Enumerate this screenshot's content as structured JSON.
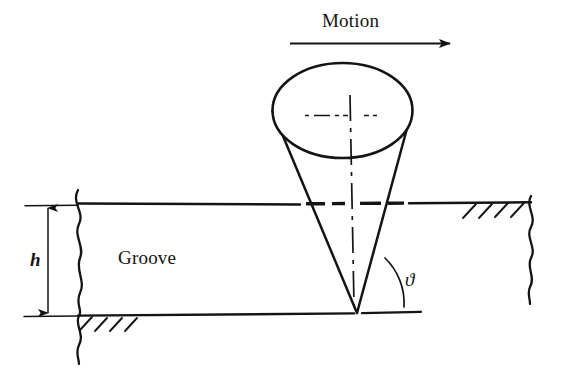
{
  "figure": {
    "type": "engineering-diagram",
    "background_color": "#ffffff",
    "line_color": "#141414",
    "labels": {
      "motion": "Motion",
      "groove": "Groove",
      "depth": "h",
      "angle": "ϑ"
    },
    "annotations": {
      "motion_arrow_direction": "right",
      "depth_dimension": "h",
      "angle_symbol": "ϑ",
      "hatching": "section-hatch"
    },
    "geometry": {
      "cone": {
        "ellipse_center_x": 342,
        "ellipse_center_y": 110,
        "ellipse_rx": 70,
        "ellipse_ry": 47,
        "apex_x": 357,
        "apex_y": 313
      },
      "workpiece": {
        "top_surface_y": 204,
        "bottom_surface_y": 315,
        "left_break_x": 78,
        "right_break_x": 530
      },
      "motion_arrow": {
        "x_start": 290,
        "x_end": 455,
        "y": 43
      },
      "dimension_line": {
        "x": 48,
        "y_top": 206,
        "y_bottom": 315
      }
    }
  }
}
